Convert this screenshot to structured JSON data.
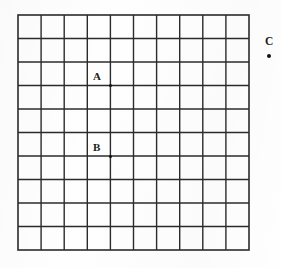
{
  "figure": {
    "name": "square-grid-with-labeled-points",
    "background_color": "#fefefe",
    "line_color": "#2b2b2b",
    "point_color": "#111111"
  },
  "grid": {
    "columns": 10,
    "rows": 10,
    "left": 18,
    "top": 15,
    "right": 249,
    "bottom": 250,
    "cell_width": 23.1,
    "cell_height": 23.5,
    "line_width": 1.4,
    "border_width": 1.6,
    "grid_on": true
  },
  "points": [
    {
      "id": "A",
      "label": "A",
      "label_x": 93,
      "label_y": 71,
      "dot_x": 110.2,
      "dot_y": 85.2,
      "grid_col": 4,
      "grid_row": 3,
      "inside_grid": true
    },
    {
      "id": "B",
      "label": "B",
      "label_x": 93,
      "label_y": 142,
      "dot_x": 110.2,
      "dot_y": 156.2,
      "grid_col": 4,
      "grid_row": 6,
      "inside_grid": true
    },
    {
      "id": "C",
      "label": "C",
      "label_x": 265,
      "label_y": 36,
      "dot_x": 269.3,
      "dot_y": 56.3,
      "grid_col": null,
      "grid_row": null,
      "inside_grid": false
    }
  ]
}
